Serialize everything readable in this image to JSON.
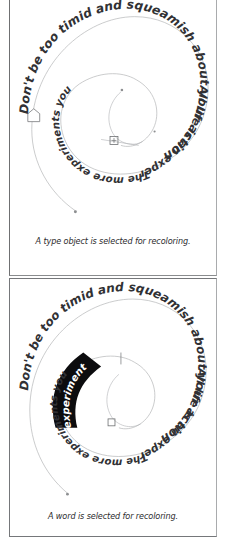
{
  "document": {
    "title": "Recoloring artwork selection examples",
    "background_color": "#ffffff",
    "text_color": "#313134",
    "highlight_color": "#0c0c0e",
    "highlight_text_color": "#ffffff",
    "path_stroke_color": "#b4b5b7",
    "panel_border_color": "#75777a"
  },
  "panels": [
    {
      "id": "type-object-panel",
      "caption": "A type object is selected for recoloring.",
      "artwork": {
        "kind": "spiral-type-on-path",
        "text": "Don't be too timid and squeamish about your actions. All life is an experiment. The more experiments you make the better.",
        "segments": [
          "Don't be too timid and squeamish about your actions.",
          "All life is an experiment.",
          "The more experiments you make the better."
        ],
        "selection": "whole-type-object",
        "selected_text": "",
        "markers": [
          "path-start-anchor",
          "center-anchor-point",
          "bezier-handle",
          "end-anchor-dot"
        ]
      }
    },
    {
      "id": "word-panel",
      "caption": "A word is selected for recoloring.",
      "artwork": {
        "kind": "spiral-type-on-path",
        "text": "Don't be too timid and squeamish about your actions. All life is an experiment. The more experiments you make the better.",
        "segments": [
          "Don't be too timid and squeamish about your actions.",
          "All life is an experiment.",
          "The more experiments you make the better."
        ],
        "selection": "word",
        "selected_text": "experiments",
        "markers": [
          "center-anchor-point",
          "insertion-caret",
          "end-anchor-dot"
        ]
      }
    }
  ]
}
